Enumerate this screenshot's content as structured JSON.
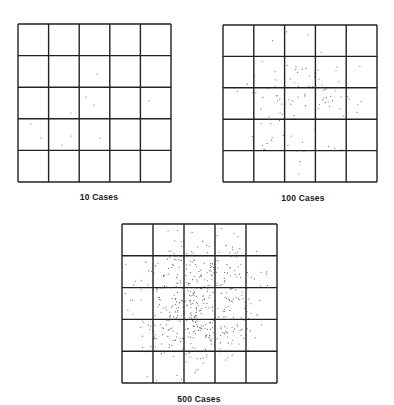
{
  "figure": {
    "grid": {
      "rows": 5,
      "cols": 5,
      "line_color": "#222222",
      "dot_color": "#555555"
    },
    "panels": [
      {
        "id": "p10",
        "label": "10 Cases",
        "cases": 10,
        "box": {
          "x": 18,
          "y": 24,
          "w": 153,
          "h": 158
        },
        "caption_pos": {
          "x": 99,
          "y": 192
        },
        "dots": [
          [
            97,
            74
          ],
          [
            86,
            97
          ],
          [
            94,
            105
          ],
          [
            71,
            113
          ],
          [
            149,
            101
          ],
          [
            31,
            124
          ],
          [
            41,
            138
          ],
          [
            71,
            136
          ],
          [
            62,
            145
          ],
          [
            100,
            138
          ]
        ]
      },
      {
        "id": "p100",
        "label": "100 Cases",
        "cases": 100,
        "box": {
          "x": 223,
          "y": 25,
          "w": 154,
          "h": 157
        },
        "caption_pos": {
          "x": 303,
          "y": 193
        },
        "seed": 7,
        "spread": 0.2
      },
      {
        "id": "p500",
        "label": "500 Cases",
        "cases": 500,
        "box": {
          "x": 122,
          "y": 224,
          "w": 155,
          "h": 159
        },
        "caption_pos": {
          "x": 199,
          "y": 394
        },
        "seed": 31,
        "spread": 0.21
      }
    ]
  }
}
